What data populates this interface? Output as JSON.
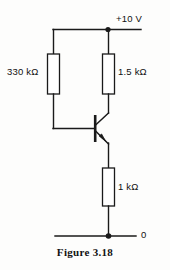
{
  "figure": {
    "caption": "Figure 3.18",
    "type": "electronic-schematic"
  },
  "nodes": {
    "supply_label": "+10 V",
    "ground_label": "0"
  },
  "components": [
    {
      "id": "r-base",
      "kind": "resistor",
      "label": "330 kΩ",
      "value": 330,
      "unit": "kΩ",
      "position": "left-branch"
    },
    {
      "id": "r-collector",
      "kind": "resistor",
      "label": "1.5 kΩ",
      "value": 1.5,
      "unit": "kΩ",
      "position": "right-branch-top"
    },
    {
      "id": "r-emitter",
      "kind": "resistor",
      "label": "1 kΩ",
      "value": 1,
      "unit": "kΩ",
      "position": "right-branch-bottom"
    },
    {
      "id": "q1",
      "kind": "transistor-npn",
      "label": "",
      "position": "center"
    }
  ],
  "icons": {
    "junction_dot": "junction-dot",
    "arrow_emitter": "emitter-arrow"
  },
  "colors": {
    "wire": "#1a1a1a",
    "background": "#fdfdfc",
    "text": "#111111"
  }
}
